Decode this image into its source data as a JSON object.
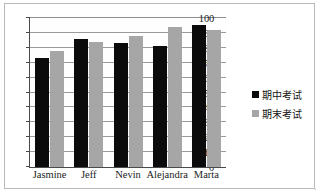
{
  "chart_data": {
    "type": "bar",
    "title": "",
    "xlabel": "",
    "ylabel": "",
    "categories": [
      "Jasmine",
      "Jeff",
      "Nevin",
      "Alejandra",
      "Marta"
    ],
    "series": [
      {
        "name": "期中考试",
        "color": "#0b0b0b",
        "values": [
          73,
          86,
          83,
          81,
          95
        ]
      },
      {
        "name": "期末考试",
        "color": "#a6a6a6",
        "values": [
          78,
          84,
          88,
          94,
          92
        ]
      }
    ],
    "ylim": [
      0,
      100
    ],
    "yticks": [
      0,
      10,
      20,
      30,
      40,
      50,
      60,
      70,
      80,
      90,
      100
    ],
    "ytick_labels": [
      "0",
      "10",
      "20",
      "30",
      "40",
      "50",
      "60",
      "70",
      "80",
      "90",
      "100"
    ],
    "grid": true,
    "grid_axis": "y",
    "legend_position": "right"
  },
  "legend": {
    "entries": [
      {
        "label": "期中考试",
        "swatch": "black-square-swatch"
      },
      {
        "label": "期末考试",
        "swatch": "gray-square-swatch"
      }
    ]
  },
  "colors": {
    "midterm": "#0b0b0b",
    "final": "#a6a6a6",
    "gridline": "#9a9a9a",
    "axis": "#4a4a4a",
    "frame_border": "#b9b9b9",
    "background": "#ffffff"
  }
}
